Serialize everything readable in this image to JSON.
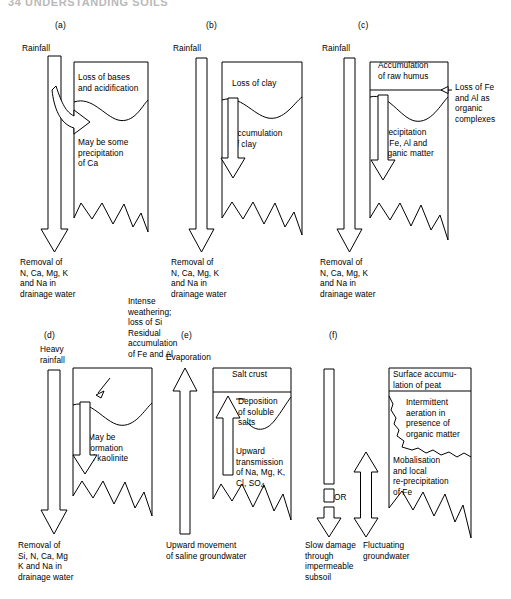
{
  "header": {
    "text": "34   UNDERSTANDING SOILS"
  },
  "figure": {
    "panels": [
      {
        "id": "a",
        "label": "(a)",
        "input_label": "Rainfall",
        "horizon_top_text": "Loss of bases\nand acidification",
        "horizon_mid_text": "May be some\nprecipitation\nof Ca",
        "output_label": "Removal of\nN, Ca, Mg, K\nand Na in\ndrainage water"
      },
      {
        "id": "b",
        "label": "(b)",
        "input_label": "Rainfall",
        "horizon_top_text": "Loss of clay",
        "horizon_mid_text": "Accumulation\nof clay",
        "output_label": "Removal of\nN, Ca, Mg, K\nand Na in\ndrainage water"
      },
      {
        "id": "c",
        "label": "(c)",
        "input_label": "Rainfall",
        "horizon_top_text": "Accumulation\nof raw humus",
        "horizon_mid_text": "Precipitation\nof Fe, Al and\norganic matter",
        "side_note": "Loss of Fe\nand Al as\norganic\ncomplexes",
        "output_label": "Removal of\nN, Ca, Mg, K\nand Na in\ndrainage water"
      },
      {
        "id": "d",
        "label": "(d)",
        "input_label": "Heavy\nrainfall",
        "top_note": "Intense\nweathering;\nloss of Si\nResidual\naccumulation\nof Fe and Al",
        "horizon_mid_text": "May be\nformation\nof kaolinite",
        "output_label": "Removal of\nSi, N, Ca, Mg\nK and Na in\ndrainage water"
      },
      {
        "id": "e",
        "label": "(e)",
        "input_label": "Evaporation",
        "horizon_top_text": "Salt crust",
        "deposition_note": "Deposition\nof soluble\nsalts",
        "horizon_mid_text": "Upward\ntransmission\nof Na, Mg, K,\nCl, SO",
        "horizon_mid_sub": "4",
        "output_label": "Upward movement\nof saline groundwater"
      },
      {
        "id": "f",
        "label": "(f)",
        "or_label": "OR",
        "horizon_top_text": "Surface accumu-\nlation of peat",
        "horizon_mid_text": "Intermittent\naeration in\npresence of\norganic matter",
        "horizon_low_text": "Mobalisation\nand local\nre-precipitation\nof Fe",
        "output_label_left": "Slow damage\nthrough\nimpermeable\nsubsoil",
        "output_label_right": "Fluctuating\ngroundwater"
      }
    ]
  },
  "colors": {
    "ink": "#000000",
    "paper": "#ffffff",
    "header_gray": "#b9b9b9"
  }
}
